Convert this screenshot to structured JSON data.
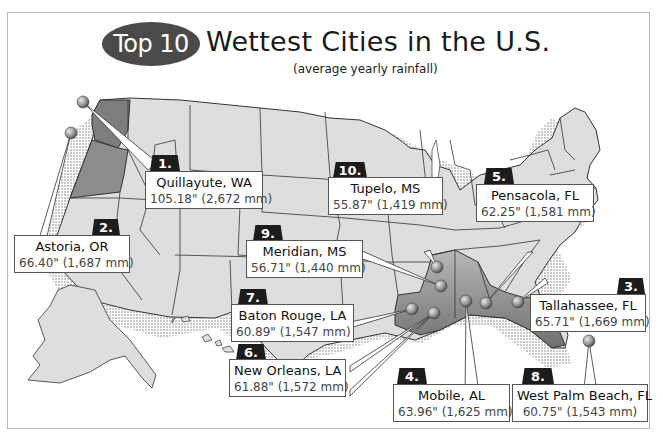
{
  "header": {
    "badge": "Top 10",
    "title": "Wettest Cities in the U.S.",
    "subtitle": "(average yearly rainfall)"
  },
  "colors": {
    "state_fill": "#dedede",
    "highlight_fill": "#8c8c8c",
    "state_stroke": "#333333",
    "badge_bg": "#4a4a4a",
    "rank_bg": "#1c1c1c",
    "pin_fill": "#a0a0a0"
  },
  "cities": [
    {
      "rank": "1.",
      "name": "Quillayute, WA",
      "rainfall": "105.18\" (2,672 mm)"
    },
    {
      "rank": "2.",
      "name": "Astoria, OR",
      "rainfall": "66.40\" (1,687 mm)"
    },
    {
      "rank": "3.",
      "name": "Tallahassee, FL",
      "rainfall": "65.71\" (1,669 mm)"
    },
    {
      "rank": "4.",
      "name": "Mobile, AL",
      "rainfall": "63.96\" (1,625 mm)"
    },
    {
      "rank": "5.",
      "name": "Pensacola, FL",
      "rainfall": "62.25\" (1,581 mm)"
    },
    {
      "rank": "6.",
      "name": "New Orleans, LA",
      "rainfall": "61.88\" (1,572 mm)"
    },
    {
      "rank": "7.",
      "name": "Baton Rouge, LA",
      "rainfall": "60.89\" (1,547 mm)"
    },
    {
      "rank": "8.",
      "name": "West Palm Beach, FL",
      "rainfall": "60.75\" (1,543 mm)"
    },
    {
      "rank": "9.",
      "name": "Meridian, MS",
      "rainfall": "56.71\" (1,440 mm)"
    },
    {
      "rank": "10.",
      "name": "Tupelo, MS",
      "rainfall": "55.87\" (1,419 mm)"
    }
  ]
}
